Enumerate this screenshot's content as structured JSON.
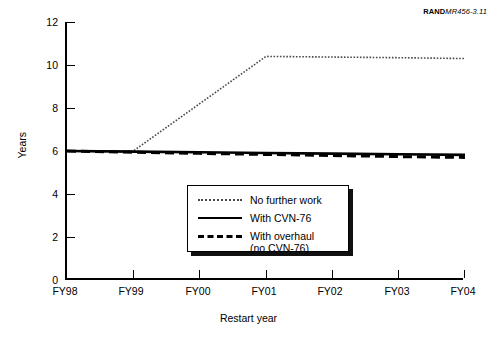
{
  "credit": {
    "brand": "RAND",
    "code": "MR456-3.11"
  },
  "chart_data": {
    "type": "line",
    "title": "",
    "subtitle": "",
    "xlabel": "Restart year",
    "ylabel": "Years",
    "categories": [
      "FY98",
      "FY99",
      "FY00",
      "FY01",
      "FY02",
      "FY03",
      "FY04"
    ],
    "x": [
      1998,
      1999,
      2000,
      2001,
      2002,
      2003,
      2004
    ],
    "xlim": [
      1998,
      2004
    ],
    "ylim": [
      0,
      12
    ],
    "yticks": [
      0,
      2,
      4,
      6,
      8,
      10,
      12
    ],
    "xticks": [
      "FY98",
      "FY99",
      "FY00",
      "FY01",
      "FY02",
      "FY03",
      "FY04"
    ],
    "grid": false,
    "legend_position": "lower-center",
    "series": [
      {
        "name": "No further work",
        "style": "dotted",
        "color": "#4a4a4a",
        "values": [
          6.0,
          6.0,
          8.2,
          10.4,
          10.37,
          10.34,
          10.3
        ]
      },
      {
        "name": "With CVN-76",
        "style": "solid",
        "color": "#000000",
        "values": [
          6.0,
          5.97,
          5.94,
          5.91,
          5.88,
          5.85,
          5.82
        ]
      },
      {
        "name": "With overhaul (no CVN-76)",
        "style": "dashed",
        "color": "#000000",
        "values": [
          6.0,
          5.94,
          5.89,
          5.84,
          5.79,
          5.74,
          5.7
        ]
      }
    ],
    "annotations": []
  },
  "legend": {
    "entries": [
      {
        "label": "No further work",
        "style": "dotted"
      },
      {
        "label": "With CVN-76",
        "style": "solid"
      },
      {
        "label": "With overhaul\n(no CVN-76)",
        "style": "dashed"
      }
    ]
  }
}
